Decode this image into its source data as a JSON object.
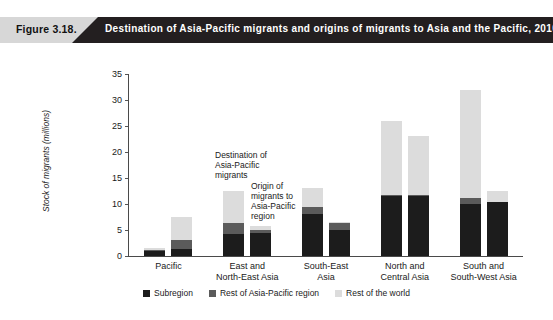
{
  "banner": {
    "figure_label": "Figure 3.18.",
    "title": "Destination of Asia-Pacific migrants and origins of migrants to Asia and the Pacific, 2010"
  },
  "annotations": [
    {
      "id": "destination",
      "text": "Destination of\nAsia-Pacific\nmigrants"
    },
    {
      "id": "origin",
      "text": "Origin of\nmigrants to\nAsia-Pacific\nregion"
    }
  ],
  "legend": [
    {
      "label": "Subregion",
      "color": "#1c1c1c"
    },
    {
      "label": "Rest of Asia-Pacific region",
      "color": "#5b5b5b"
    },
    {
      "label": "Rest of the world",
      "color": "#dcdcdc"
    }
  ],
  "chart_data": {
    "type": "bar",
    "title": "Destination of Asia-Pacific migrants and origins of migrants to Asia and the Pacific, 2010",
    "xlabel": "",
    "ylabel": "Stock of migrants (millions)",
    "ylim": [
      0,
      35
    ],
    "yticks": [
      0,
      5,
      10,
      15,
      20,
      25,
      30,
      35
    ],
    "grid": false,
    "stacked": true,
    "legend_position": "bottom",
    "categories": [
      "Pacific",
      "East and\nNorth-East Asia",
      "South-East\nAsia",
      "North and\nCentral Asia",
      "South and\nSouth-West Asia"
    ],
    "bar_groups": [
      {
        "category": "Pacific",
        "bars": [
          {
            "role": "Destination of Asia-Pacific migrants",
            "segments": {
              "Subregion": 1.0,
              "Rest of Asia-Pacific region": 0.2,
              "Rest of the world": 0.3
            },
            "total": 1.5
          },
          {
            "role": "Origin of migrants to Asia-Pacific region",
            "segments": {
              "Subregion": 1.3,
              "Rest of Asia-Pacific region": 1.7,
              "Rest of the world": 4.5
            },
            "total": 7.5
          }
        ]
      },
      {
        "category": "East and North-East Asia",
        "bars": [
          {
            "role": "Destination of Asia-Pacific migrants",
            "segments": {
              "Subregion": 4.3,
              "Rest of Asia-Pacific region": 2.0,
              "Rest of the world": 6.2
            },
            "total": 12.5
          },
          {
            "role": "Origin of migrants to Asia-Pacific region",
            "segments": {
              "Subregion": 4.5,
              "Rest of Asia-Pacific region": 0.5,
              "Rest of the world": 0.7
            },
            "total": 5.7
          }
        ]
      },
      {
        "category": "South-East Asia",
        "bars": [
          {
            "role": "Destination of Asia-Pacific migrants",
            "segments": {
              "Subregion": 8.0,
              "Rest of Asia-Pacific region": 1.5,
              "Rest of the world": 3.5
            },
            "total": 13.0
          },
          {
            "role": "Origin of migrants to Asia-Pacific region",
            "segments": {
              "Subregion": 5.0,
              "Rest of Asia-Pacific region": 1.4,
              "Rest of the world": 0.1
            },
            "total": 6.5
          }
        ]
      },
      {
        "category": "North and Central Asia",
        "bars": [
          {
            "role": "Destination of Asia-Pacific migrants",
            "segments": {
              "Subregion": 11.5,
              "Rest of Asia-Pacific region": 0.2,
              "Rest of the world": 14.3
            },
            "total": 26.0
          },
          {
            "role": "Origin of migrants to Asia-Pacific region",
            "segments": {
              "Subregion": 11.5,
              "Rest of Asia-Pacific region": 0.2,
              "Rest of the world": 11.3
            },
            "total": 23.0
          }
        ]
      },
      {
        "category": "South and South-West Asia",
        "bars": [
          {
            "role": "Destination of Asia-Pacific migrants",
            "segments": {
              "Subregion": 10.0,
              "Rest of Asia-Pacific region": 1.1,
              "Rest of the world": 20.9
            },
            "total": 32.0
          },
          {
            "role": "Origin of migrants to Asia-Pacific region",
            "segments": {
              "Subregion": 10.3,
              "Rest of Asia-Pacific region": 0.1,
              "Rest of the world": 2.1
            },
            "total": 12.5
          }
        ]
      }
    ]
  }
}
